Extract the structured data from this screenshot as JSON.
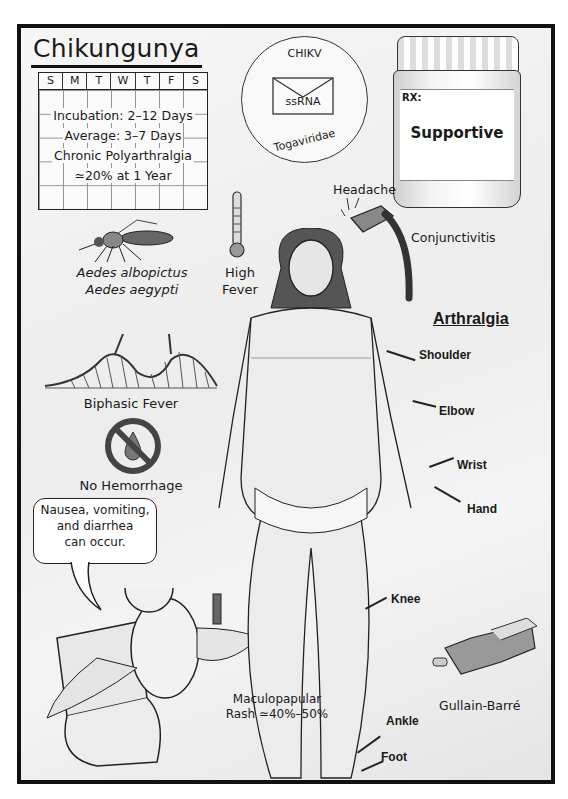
{
  "title": "Chikungunya",
  "calendar": {
    "days": [
      "S",
      "M",
      "T",
      "W",
      "T",
      "F",
      "S"
    ],
    "lines": [
      "Incubation: 2–12 Days",
      "Average: 3–7 Days",
      "Chronic Polyarthralgia",
      "≃20% at 1 Year"
    ]
  },
  "virus": {
    "top": "CHIKV",
    "center": "ssRNA",
    "bottom": "Togaviridae"
  },
  "treatment": {
    "rx": "RX:",
    "label": "Supportive"
  },
  "vectors": [
    "Aedes albopictus",
    "Aedes aegypti"
  ],
  "symptoms": {
    "headache": "Headache",
    "conjunctivitis": "Conjunctivitis",
    "fever": [
      "High",
      "Fever"
    ],
    "biphasic": "Biphasic Fever",
    "no_hemorrhage": "No Hemorrhage",
    "gi": [
      "Nausea, vomiting,",
      "and diarrhea",
      "can occur."
    ],
    "rash": [
      "Maculopapular",
      "Rash ≃40%–50%"
    ],
    "gbs": "Gullain-Barré"
  },
  "arthralgia": {
    "heading": "Arthralgia",
    "joints": [
      "Shoulder",
      "Elbow",
      "Wrist",
      "Hand",
      "Knee",
      "Ankle",
      "Foot"
    ]
  }
}
